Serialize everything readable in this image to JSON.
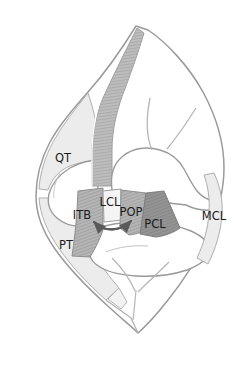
{
  "figure": {
    "view": "axial cross-section of the knee",
    "background_color": "#ffffff",
    "width": 248,
    "height": 366
  },
  "palette": {
    "outline": "#9a9a9a",
    "outline_dark": "#8c8c8c",
    "bone_fill": "#ffffff",
    "tendon_light": "#ececec",
    "band_mid": "#b3b3b3",
    "band_hatch_line": "#8e8e8e",
    "band_dark": "#8f8f8f",
    "lcl_fill": "#f2f2f2",
    "arrow": "#5a5a5a",
    "label_color": "#1a1a1a"
  },
  "labels": [
    {
      "id": "qt",
      "text": "QT",
      "x": 63,
      "y": 158,
      "describes": "quadriceps tendon"
    },
    {
      "id": "itb",
      "text": "ITB",
      "x": 82,
      "y": 215,
      "describes": "iliotibial band"
    },
    {
      "id": "lcl",
      "text": "LCL",
      "x": 109,
      "y": 202,
      "describes": "lateral collateral ligament"
    },
    {
      "id": "pop",
      "text": "POP",
      "x": 128,
      "y": 212,
      "describes": "popliteus tendon"
    },
    {
      "id": "pcl",
      "text": "PCL",
      "x": 152,
      "y": 224,
      "describes": "posterior cruciate ligament"
    },
    {
      "id": "mcl",
      "text": "MCL",
      "x": 212,
      "y": 216,
      "describes": "medial collateral ligament"
    },
    {
      "id": "pt",
      "text": "PT",
      "x": 66,
      "y": 245,
      "describes": "patellar tendon"
    }
  ],
  "structures": {
    "qt": {
      "name": "QT",
      "fill": "tendon_light",
      "hatched": false
    },
    "pt": {
      "name": "PT",
      "fill": "tendon_light",
      "hatched": false
    },
    "itb": {
      "name": "ITB",
      "fill": "band_mid",
      "hatched": true
    },
    "lcl": {
      "name": "LCL",
      "fill": "lcl_fill",
      "hatched": false
    },
    "pop": {
      "name": "POP",
      "fill": "band_mid",
      "hatched": true
    },
    "pcl": {
      "name": "PCL",
      "fill": "band_dark",
      "hatched": true
    },
    "mcl": {
      "name": "MCL",
      "fill": "tendon_light",
      "hatched": false
    },
    "patella": {
      "name": "patella",
      "fill": "bone_fill"
    },
    "femoral_condyle": {
      "name": "femoral condyle",
      "fill": "bone_fill"
    },
    "tibial_plateau": {
      "name": "tibial plateau",
      "fill": "bone_fill"
    }
  },
  "annotations": {
    "arrow": {
      "id": "itb-pop-arrow",
      "type": "double-headed-curved-arrow",
      "color": "#5a5a5a",
      "from": "ITB",
      "to": "POP"
    }
  }
}
